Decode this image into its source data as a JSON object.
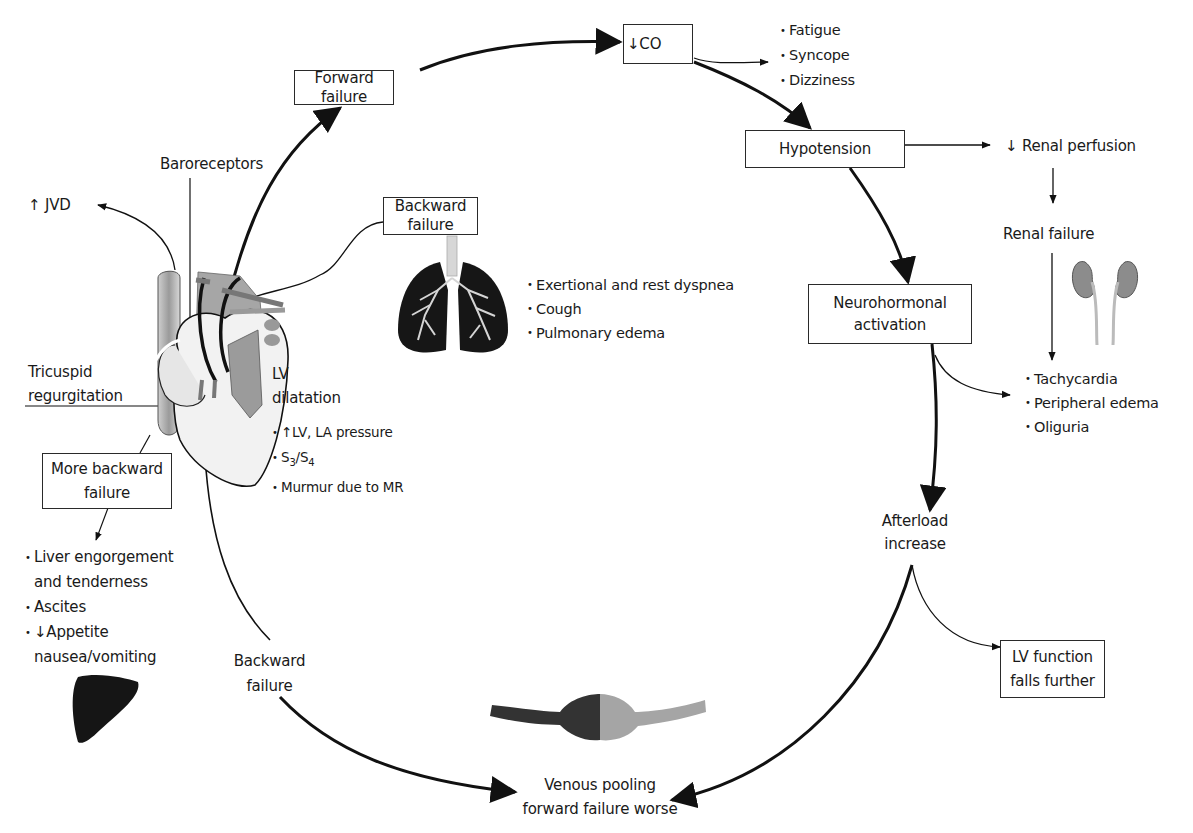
{
  "diagram": {
    "boxes": {
      "forward_failure": "Forward failure",
      "decreased_co": "↓CO",
      "hypotension": "Hypotension",
      "neurohormonal_line1": "Neurohormonal",
      "neurohormonal_line2": "activation",
      "backward_failure_top": "Backward failure",
      "more_backward_line1": "More backward",
      "more_backward_line2": "failure",
      "lv_function_line1": "LV function",
      "lv_function_line2": "falls further"
    },
    "labels": {
      "baroreceptors": "Baroreceptors",
      "jvd": "↑ JVD",
      "tricuspid_line1": "Tricuspid",
      "tricuspid_line2": "regurgitation",
      "lv_line1": "LV",
      "lv_line2": "dilatation",
      "renal_perfusion": "↓ Renal perfusion",
      "renal_failure": "Renal failure",
      "afterload_line1": "Afterload",
      "afterload_line2": "increase",
      "backward_bottom_line1": "Backward",
      "backward_bottom_line2": "failure",
      "venous_line1": "Venous pooling",
      "venous_line2": "forward failure worse"
    },
    "lists": {
      "co_symptoms": [
        "Fatigue",
        "Syncope",
        "Dizziness"
      ],
      "pulmonary_symptoms": [
        "Exertional and rest dyspnea",
        "Cough",
        "Pulmonary edema"
      ],
      "lv_signs": [
        "↑LV, LA pressure",
        "S3/S4",
        "Murmur due to MR"
      ],
      "lv_signs_s3": "S",
      "lv_signs_s3_sub": "3",
      "lv_signs_slash": "/S",
      "lv_signs_s4_sub": "4",
      "neurohormonal_effects": [
        "Tachycardia",
        "Peripheral edema",
        "Oliguria"
      ],
      "hepatic_symptoms": [
        "Liver engorgement",
        "and tenderness",
        "Ascites",
        "↓Appetite",
        "nausea/vomiting"
      ]
    },
    "illustrations": {
      "heart": "heart-illustration",
      "lungs": "lungs-illustration",
      "kidneys": "kidneys-illustration",
      "liver": "liver-illustration",
      "vein": "venous-pooling-illustration"
    },
    "colors": {
      "line": "#111111",
      "heart_gray": "#9a9a9a",
      "heart_light": "#e2e2e2",
      "lung_dark": "#161616",
      "kidney_gray": "#8c8c8c"
    }
  }
}
